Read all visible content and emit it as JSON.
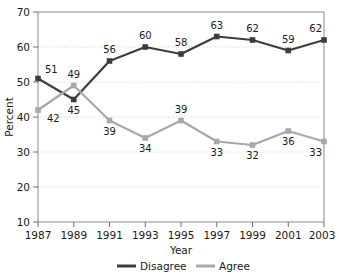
{
  "chart_data": {
    "type": "line",
    "title": "",
    "subtitle": "",
    "xlabel": "Year",
    "ylabel": "Percent",
    "categories": [
      "1987",
      "1989",
      "1991",
      "1993",
      "1995",
      "1997",
      "1999",
      "2001",
      "2003"
    ],
    "x": [
      1987,
      1989,
      1991,
      1993,
      1995,
      1997,
      1999,
      2001,
      2003
    ],
    "xlim": [
      1987,
      2003
    ],
    "ylim": [
      10,
      70
    ],
    "yticks": [
      10,
      20,
      30,
      40,
      50,
      60,
      70
    ],
    "xticks": [
      "1987",
      "1989",
      "1991",
      "1993",
      "1995",
      "1997",
      "1999",
      "2001",
      "2003"
    ],
    "grid": "horizontal-dotted",
    "legend_position": "bottom-center",
    "marker": "square",
    "series": [
      {
        "name": "Disagree",
        "color": "#3d3d3d",
        "values": [
          51,
          45,
          56,
          60,
          58,
          63,
          62,
          59,
          62
        ],
        "labels": [
          "51",
          "45",
          "56",
          "60",
          "58",
          "63",
          "62",
          "59",
          "62"
        ],
        "label_positions": [
          "above",
          "below",
          "above",
          "above",
          "above",
          "above",
          "above",
          "above",
          "above"
        ]
      },
      {
        "name": "Agree",
        "color": "#a8a8a8",
        "values": [
          42,
          49,
          39,
          34,
          39,
          33,
          32,
          36,
          33
        ],
        "labels": [
          "42",
          "49",
          "39",
          "34",
          "39",
          "33",
          "32",
          "36",
          "33"
        ],
        "label_positions": [
          "below-right",
          "above",
          "below",
          "below",
          "above",
          "below",
          "below",
          "below",
          "below"
        ]
      }
    ]
  },
  "legend": {
    "items": [
      {
        "label": "Disagree",
        "color": "#3d3d3d"
      },
      {
        "label": "Agree",
        "color": "#a8a8a8"
      }
    ]
  },
  "axes": {
    "y_title": "Percent",
    "x_title": "Year",
    "y_tick_labels": [
      "70",
      "60",
      "50",
      "40",
      "30",
      "20",
      "10"
    ],
    "x_tick_labels": [
      "1987",
      "1989",
      "1991",
      "1993",
      "1995",
      "1997",
      "1999",
      "2001",
      "2003"
    ]
  }
}
